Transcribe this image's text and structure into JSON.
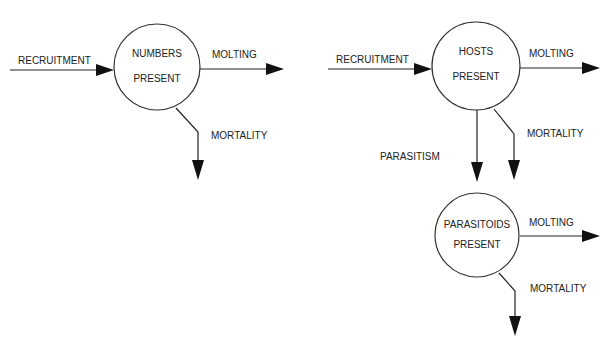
{
  "diagram": {
    "left_model": {
      "node": {
        "line1": "NUMBERS",
        "line2": "PRESENT"
      },
      "inflow": "RECRUITMENT",
      "outflow_right": "MOLTING",
      "outflow_down": "MORTALITY"
    },
    "right_model": {
      "host_node": {
        "line1": "HOSTS",
        "line2": "PRESENT"
      },
      "host_inflow": "RECRUITMENT",
      "host_outflow_right": "MOLTING",
      "host_outflow_down": "MORTALITY",
      "link_label": "PARASITISM",
      "parasitoid_node": {
        "line1": "PARASITOIDS",
        "line2": "PRESENT"
      },
      "parasitoid_outflow_right": "MOLTING",
      "parasitoid_outflow_down": "MORTALITY"
    }
  }
}
